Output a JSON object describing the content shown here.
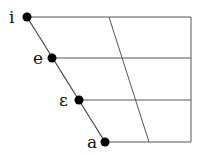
{
  "diagram": {
    "type": "vowel-quadrilateral",
    "colors": {
      "line": "#555555",
      "dot": "#000000",
      "text": "#111111"
    },
    "vowels": [
      {
        "symbol": "i",
        "x": 27,
        "y": 17
      },
      {
        "symbol": "e",
        "x": 52,
        "y": 58
      },
      {
        "symbol": "ε",
        "x": 79,
        "y": 100
      },
      {
        "symbol": "a",
        "x": 105,
        "y": 142
      }
    ]
  }
}
